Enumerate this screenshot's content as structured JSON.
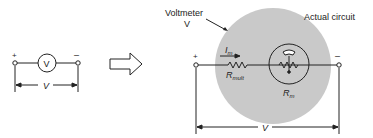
{
  "left_circuit": {
    "plus": "+",
    "minus": "–",
    "meter_symbol": "V",
    "dimension_label": "V"
  },
  "arrow": {
    "icon": "double-arrow-right-icon"
  },
  "right_circuit": {
    "voltmeter_label_line1": "Voltmeter",
    "voltmeter_label_line2": "V",
    "actual_circuit_label": "Actual circuit",
    "plus": "+",
    "minus": "–",
    "current_label": "I",
    "current_sub": "m",
    "rmult_label": "R",
    "rmult_sub": "mult",
    "rm_label": "R",
    "rm_sub": "m",
    "dimension_label": "V",
    "colors": {
      "circle_fill": "#c9c9c9",
      "line": "#222222"
    }
  }
}
